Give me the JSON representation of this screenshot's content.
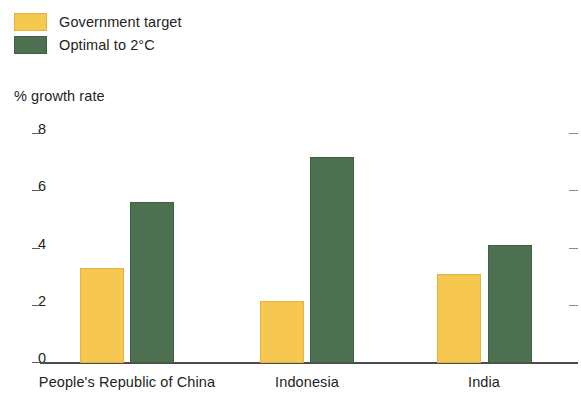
{
  "legend": {
    "items": [
      {
        "label": "Government target",
        "color": "#f6c84f",
        "swatch_name": "legend-swatch-government-target"
      },
      {
        "label": "Optimal to 2°C",
        "color": "#4c7050",
        "swatch_name": "legend-swatch-optimal-2c"
      }
    ]
  },
  "axis_title": "% growth rate",
  "chart_data": {
    "type": "bar",
    "title": "",
    "subtitle": "",
    "xlabel": "",
    "ylabel": "% growth rate",
    "ylim": [
      0,
      8
    ],
    "yticks": [
      0,
      2,
      4,
      6,
      8
    ],
    "ytick_labels": [
      "0",
      "2",
      "4",
      "6",
      "8"
    ],
    "grid": false,
    "legend_position": "top-left",
    "categories": [
      "People's Republic of China",
      "Indonesia",
      "India"
    ],
    "series": [
      {
        "name": "Government target",
        "color": "#f6c84f",
        "values": [
          3.3,
          2.15,
          3.1
        ]
      },
      {
        "name": "Optimal to 2°C",
        "color": "#4c7050",
        "values": [
          5.6,
          7.15,
          4.1
        ]
      }
    ]
  }
}
